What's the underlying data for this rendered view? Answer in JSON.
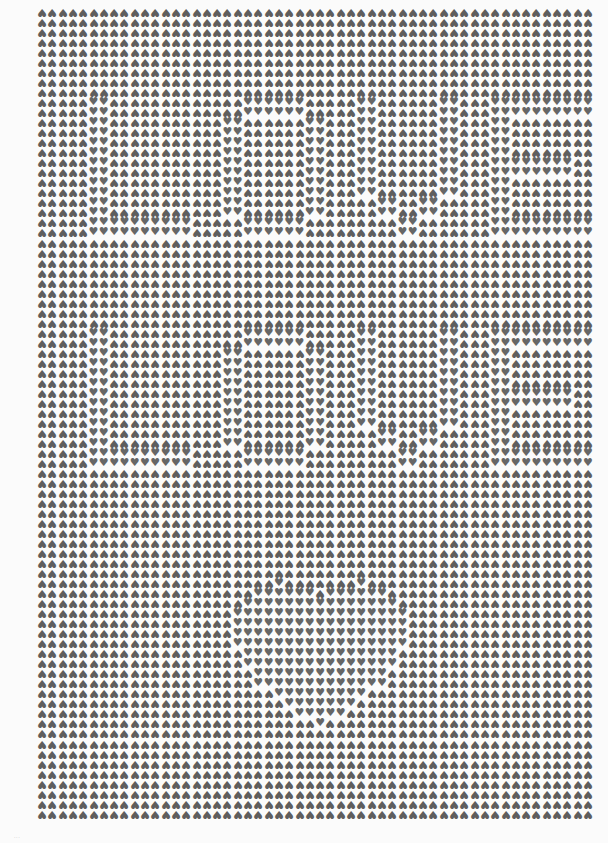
{
  "artwork": {
    "glyph": "♥",
    "background_orientation": "inverted",
    "pattern_orientation": "upright",
    "colors": {
      "heart": "#5e5e5e",
      "paper": "#fbfbfb"
    },
    "grid": {
      "cols": 54,
      "rows": 81,
      "pitch_x": 10.3,
      "pitch_y": 10.02
    },
    "hidden_words": [
      "LOVE",
      "LOVE"
    ],
    "hidden_shape": "heart"
  },
  "caption": "..."
}
